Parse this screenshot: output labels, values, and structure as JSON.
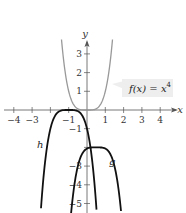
{
  "chart_data": {
    "type": "line",
    "title": "",
    "xlabel": "x",
    "ylabel": "y",
    "xlim": [
      -4.7,
      4.9
    ],
    "ylim": [
      -5.5,
      4.2
    ],
    "grid": false,
    "x_ticks": [
      -4,
      -3,
      -1,
      1,
      2,
      3,
      4
    ],
    "x_tick_labels": [
      "−4",
      "−3",
      "−1",
      "1",
      "2",
      "3",
      "4"
    ],
    "y_ticks": [
      3,
      2,
      1,
      -1,
      -3,
      -4,
      -5
    ],
    "y_tick_labels": [
      "3",
      "2",
      "1",
      "−1",
      "−3",
      "−4",
      "−5"
    ],
    "series": [
      {
        "name": "f",
        "label": "f(x) = x⁴",
        "expression": "x^4",
        "color": "#999999",
        "vertex": [
          0,
          0
        ],
        "annotation": "callout box"
      },
      {
        "name": "h",
        "label": "h",
        "expression": "-(x+1)^4",
        "color": "#111111",
        "vertex": [
          -1,
          0
        ]
      },
      {
        "name": "g",
        "label": "g",
        "expression": "-(x-0.5)^4 - 2",
        "color": "#111111",
        "vertex": [
          0.5,
          -2
        ]
      }
    ]
  },
  "labels": {
    "x_axis": "x",
    "y_axis": "y",
    "f_callout_prefix": "f(x) = x",
    "f_callout_exp": "4",
    "h": "h",
    "g": "g"
  },
  "ticks": {
    "x": [
      {
        "v": -4,
        "t": "−4"
      },
      {
        "v": -3,
        "t": "−3"
      },
      {
        "v": -2,
        "t": ""
      },
      {
        "v": -1,
        "t": "−1"
      },
      {
        "v": 1,
        "t": "1"
      },
      {
        "v": 2,
        "t": "2"
      },
      {
        "v": 3,
        "t": "3"
      },
      {
        "v": 4,
        "t": "4"
      }
    ],
    "y": [
      {
        "v": 3,
        "t": "3"
      },
      {
        "v": 2,
        "t": "2"
      },
      {
        "v": 1,
        "t": "1"
      },
      {
        "v": -1,
        "t": "−1"
      },
      {
        "v": -2,
        "t": ""
      },
      {
        "v": -3,
        "t": "−3"
      },
      {
        "v": -4,
        "t": "−4"
      },
      {
        "v": -5,
        "t": "−5"
      }
    ]
  },
  "colors": {
    "axis": "#555555",
    "f_curve": "#9a9a9a",
    "transformed_curves": "#111111",
    "callout_bg": "#eeeeee"
  }
}
